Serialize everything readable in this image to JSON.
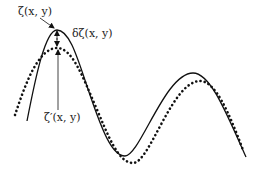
{
  "diagram": {
    "title": "",
    "labels": {
      "zeta": "ζ(x, y)",
      "delta_zeta": "δζ(x, y)",
      "zeta_prime": "ζ′(x, y)"
    },
    "curves": [
      {
        "name": "zeta",
        "style": "solid",
        "description": "original surface ζ(x, y)"
      },
      {
        "name": "zeta_prime",
        "style": "dotted",
        "description": "perturbed surface ζ′(x, y)"
      }
    ],
    "annotations": [
      {
        "name": "delta-zeta",
        "type": "double-arrow",
        "between": [
          "zeta peak",
          "zeta_prime peak"
        ]
      }
    ],
    "colors": {
      "line": "#111111",
      "text": "#222222",
      "background": "#ffffff"
    }
  }
}
